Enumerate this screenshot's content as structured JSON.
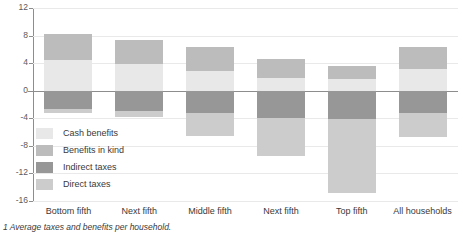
{
  "chart_data": {
    "type": "bar",
    "title": "",
    "subtitle": "",
    "xlabel": "",
    "ylabel": "",
    "stacked": true,
    "grid": true,
    "legend_position": "inside-left",
    "ylim": [
      -16,
      12
    ],
    "yticks": [
      12,
      8,
      4,
      0,
      -4,
      -8,
      -12,
      -16
    ],
    "ytick_labels": [
      "12",
      "8",
      "4",
      "0",
      "-4",
      "-8",
      "-12",
      "-16"
    ],
    "categories": [
      "Bottom fifth",
      "Next fifth",
      "Middle fifth",
      "Next fifth",
      "Top fifth",
      "All households"
    ],
    "series": [
      {
        "name": "Cash benefits",
        "color": "#e8e8e8",
        "values": [
          4.4,
          3.9,
          2.8,
          1.8,
          1.7,
          3.2
        ]
      },
      {
        "name": "Benefits in kind",
        "color": "#bcbcbc",
        "values": [
          3.9,
          3.5,
          3.6,
          2.8,
          1.9,
          3.2
        ]
      },
      {
        "name": "Indirect taxes",
        "color": "#979797",
        "values": [
          -2.6,
          -2.9,
          -3.3,
          -3.9,
          -4.1,
          -3.3
        ]
      },
      {
        "name": "Direct taxes",
        "color": "#cccccc",
        "values": [
          -0.7,
          -0.9,
          -3.2,
          -5.5,
          -10.7,
          -3.4
        ]
      }
    ],
    "footnote": "1 Average taxes and benefits per household."
  },
  "legend": {
    "items": [
      {
        "label": "Cash benefits"
      },
      {
        "label": "Benefits in kind"
      },
      {
        "label": "Indirect taxes"
      },
      {
        "label": "Direct taxes"
      }
    ]
  }
}
